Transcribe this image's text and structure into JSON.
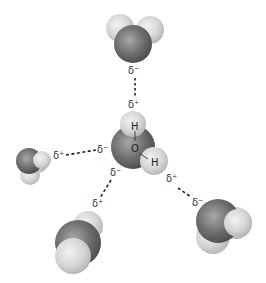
{
  "diagram": {
    "type": "hydrogen-bonding-water",
    "central_molecule": {
      "atoms": {
        "oxygen": "O",
        "hydrogen_1": "H",
        "hydrogen_2": "H"
      }
    },
    "charges": {
      "top_mol_minus": "δ⁻",
      "central_h_top_plus": "δ⁺",
      "left_mol_plus": "δ⁺",
      "central_o_left_minus": "δ⁻",
      "central_o_bottom_minus": "δ⁻",
      "bottom_left_mol_plus": "δ⁺",
      "central_h_right_plus": "δ⁺",
      "bottom_right_mol_minus": "δ⁻"
    },
    "colors": {
      "oxygen": "#6b6b6b",
      "hydrogen": "#dcdcdc",
      "bond_line": "#222222"
    }
  }
}
